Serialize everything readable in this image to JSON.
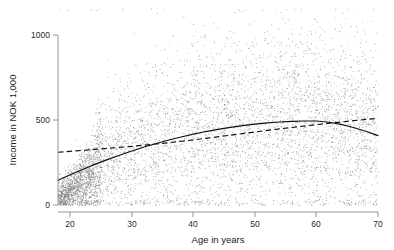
{
  "chart_data": {
    "type": "scatter",
    "title": "",
    "xlabel": "Age in years",
    "ylabel": "Income in NOK 1,000",
    "xlim": [
      18,
      70
    ],
    "ylim": [
      0,
      1180
    ],
    "xticks": [
      20,
      30,
      40,
      50,
      60,
      70
    ],
    "yticks": [
      0,
      500,
      1000
    ],
    "xtick_labels": [
      "20",
      "30",
      "40",
      "50",
      "60",
      "70"
    ],
    "ytick_labels": [
      "0",
      "500",
      "1000"
    ],
    "grid": false,
    "legend": "none",
    "point_color": "#7a7a7a",
    "point_size": 0.8,
    "n_points_approx": 6000,
    "series": [
      {
        "name": "scatter-cloud",
        "type": "scatter",
        "description": "Individual observations of income in NOK 1,000 by age in years",
        "x_range": [
          18,
          70
        ],
        "y_range": [
          0,
          1180
        ],
        "density_notes": "Very dense in the lower left (ages 18-25, income 0-200); broad spread 100-800 for ages 30-65; thins above 900."
      },
      {
        "name": "quadratic-fit",
        "type": "line",
        "style": "solid",
        "color": "#111111",
        "x": [
          18,
          20,
          22,
          24,
          26,
          28,
          30,
          32,
          34,
          36,
          38,
          40,
          42,
          44,
          46,
          48,
          50,
          52,
          54,
          56,
          58,
          60,
          62,
          64,
          66,
          68,
          70
        ],
        "y": [
          145,
          178,
          209,
          239,
          267,
          293,
          318,
          341,
          362,
          382,
          400,
          417,
          432,
          445,
          457,
          467,
          476,
          483,
          488,
          492,
          494,
          494,
          487,
          474,
          456,
          434,
          408
        ]
      },
      {
        "name": "linear-fit",
        "type": "line",
        "style": "dashed",
        "color": "#111111",
        "x": [
          18,
          24,
          30,
          36,
          42,
          48,
          54,
          60,
          66,
          70
        ],
        "y": [
          310,
          327,
          345,
          366,
          392,
          420,
          448,
          473,
          496,
          510
        ]
      }
    ]
  },
  "axes": {
    "x": {
      "label": "Age in years",
      "ticks": [
        "20",
        "30",
        "40",
        "50",
        "60",
        "70"
      ]
    },
    "y": {
      "label": "Income in NOK 1,000",
      "ticks": [
        "1000",
        "500",
        "0"
      ]
    }
  }
}
